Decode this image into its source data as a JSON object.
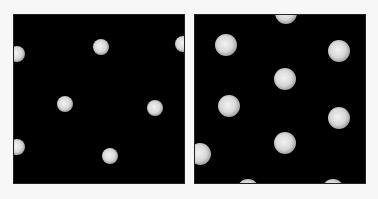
{
  "figure": {
    "background": "#f7f7f7",
    "panels": [
      {
        "id": "left",
        "x": 13,
        "y": 14,
        "width": 172,
        "height": 170,
        "background": "#000000",
        "dot_radius": 8,
        "dots": [
          {
            "cx": 16,
            "cy": 53
          },
          {
            "cx": 100,
            "cy": 46
          },
          {
            "cx": 182,
            "cy": 43
          },
          {
            "cx": 64,
            "cy": 103
          },
          {
            "cx": 154,
            "cy": 107
          },
          {
            "cx": 16,
            "cy": 146
          },
          {
            "cx": 109,
            "cy": 155
          }
        ]
      },
      {
        "id": "right",
        "x": 194,
        "y": 14,
        "width": 172,
        "height": 170,
        "background": "#000000",
        "dot_radius": 11,
        "dots": [
          {
            "cx": 285,
            "cy": 12
          },
          {
            "cx": 225,
            "cy": 44
          },
          {
            "cx": 338,
            "cy": 50
          },
          {
            "cx": 284,
            "cy": 78
          },
          {
            "cx": 228,
            "cy": 105
          },
          {
            "cx": 338,
            "cy": 117
          },
          {
            "cx": 284,
            "cy": 142
          },
          {
            "cx": 199,
            "cy": 153
          },
          {
            "cx": 247,
            "cy": 189
          },
          {
            "cx": 332,
            "cy": 189
          }
        ]
      }
    ]
  }
}
